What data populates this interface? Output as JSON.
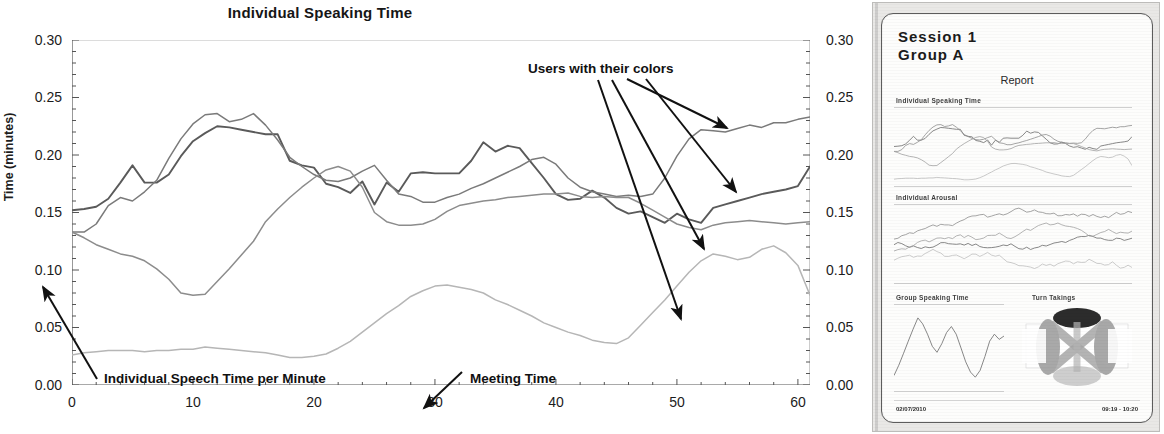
{
  "chart_data": {
    "type": "line",
    "title": "Individual Speaking Time",
    "xlabel": "Meeting Time",
    "ylabel": "Time (minutes)",
    "xlim": [
      0,
      61
    ],
    "ylim": [
      0.0,
      0.3
    ],
    "grid": false,
    "legend": "none",
    "x_ticks": [
      "0",
      "10",
      "20",
      "30",
      "40",
      "50",
      "60"
    ],
    "y_ticks": [
      "0.00",
      "0.05",
      "0.10",
      "0.15",
      "0.20",
      "0.25",
      "0.30"
    ],
    "y_ticks_right": [
      "0.00",
      "0.05",
      "0.10",
      "0.15",
      "0.20",
      "0.25",
      "0.30"
    ],
    "annotations": [
      {
        "text": "Users with their colors",
        "points_to": "four line series"
      },
      {
        "text": "Individual Speech Time per Minute",
        "points_to": "y axis"
      },
      {
        "text": "Meeting Time",
        "points_to": "x axis"
      }
    ],
    "x": [
      0,
      1,
      2,
      3,
      4,
      5,
      6,
      7,
      8,
      9,
      10,
      11,
      12,
      13,
      14,
      15,
      16,
      17,
      18,
      19,
      20,
      21,
      22,
      23,
      24,
      25,
      26,
      27,
      28,
      29,
      30,
      31,
      32,
      33,
      34,
      35,
      36,
      37,
      38,
      39,
      40,
      41,
      42,
      43,
      44,
      45,
      46,
      47,
      48,
      49,
      50,
      51,
      52,
      53,
      54,
      55,
      56,
      57,
      58,
      59,
      60,
      61
    ],
    "series": [
      {
        "name": "User 1",
        "color": "#5a5a5a",
        "values": [
          0.152,
          0.153,
          0.155,
          0.162,
          0.176,
          0.191,
          0.176,
          0.176,
          0.183,
          0.199,
          0.212,
          0.219,
          0.225,
          0.224,
          0.222,
          0.22,
          0.218,
          0.218,
          0.195,
          0.191,
          0.189,
          0.175,
          0.172,
          0.167,
          0.177,
          0.157,
          0.176,
          0.168,
          0.184,
          0.185,
          0.184,
          0.184,
          0.184,
          0.195,
          0.211,
          0.203,
          0.208,
          0.206,
          0.193,
          0.18,
          0.166,
          0.161,
          0.162,
          0.169,
          0.163,
          0.154,
          0.149,
          0.151,
          0.146,
          0.141,
          0.149,
          0.144,
          0.141,
          0.154,
          0.157,
          0.16,
          0.163,
          0.166,
          0.168,
          0.17,
          0.173,
          0.19
        ]
      },
      {
        "name": "User 2",
        "color": "#7a7a7a",
        "values": [
          0.133,
          0.133,
          0.14,
          0.156,
          0.163,
          0.16,
          0.168,
          0.178,
          0.197,
          0.214,
          0.227,
          0.235,
          0.236,
          0.229,
          0.231,
          0.236,
          0.226,
          0.213,
          0.198,
          0.19,
          0.183,
          0.178,
          0.177,
          0.18,
          0.186,
          0.191,
          0.178,
          0.166,
          0.164,
          0.159,
          0.159,
          0.163,
          0.166,
          0.171,
          0.175,
          0.18,
          0.185,
          0.19,
          0.196,
          0.198,
          0.192,
          0.18,
          0.172,
          0.168,
          0.166,
          0.164,
          0.165,
          0.164,
          0.166,
          0.18,
          0.199,
          0.214,
          0.222,
          0.221,
          0.22,
          0.223,
          0.226,
          0.224,
          0.228,
          0.228,
          0.231,
          0.233
        ]
      },
      {
        "name": "User 3",
        "color": "#8c8c8c",
        "values": [
          0.133,
          0.128,
          0.122,
          0.118,
          0.114,
          0.112,
          0.108,
          0.101,
          0.092,
          0.08,
          0.078,
          0.079,
          0.09,
          0.101,
          0.113,
          0.125,
          0.142,
          0.153,
          0.163,
          0.172,
          0.18,
          0.187,
          0.19,
          0.186,
          0.172,
          0.15,
          0.142,
          0.139,
          0.139,
          0.14,
          0.144,
          0.151,
          0.156,
          0.158,
          0.16,
          0.161,
          0.163,
          0.164,
          0.165,
          0.166,
          0.166,
          0.167,
          0.164,
          0.163,
          0.164,
          0.163,
          0.163,
          0.158,
          0.152,
          0.146,
          0.14,
          0.137,
          0.135,
          0.139,
          0.141,
          0.142,
          0.143,
          0.142,
          0.141,
          0.14,
          0.141,
          0.142
        ]
      },
      {
        "name": "User 4",
        "color": "#b6b6b6",
        "values": [
          0.026,
          0.028,
          0.029,
          0.03,
          0.03,
          0.03,
          0.029,
          0.03,
          0.03,
          0.031,
          0.031,
          0.033,
          0.032,
          0.031,
          0.03,
          0.029,
          0.028,
          0.026,
          0.024,
          0.024,
          0.025,
          0.027,
          0.032,
          0.038,
          0.046,
          0.054,
          0.062,
          0.069,
          0.077,
          0.082,
          0.086,
          0.087,
          0.085,
          0.083,
          0.08,
          0.074,
          0.07,
          0.065,
          0.06,
          0.054,
          0.05,
          0.046,
          0.043,
          0.039,
          0.037,
          0.036,
          0.041,
          0.052,
          0.063,
          0.074,
          0.086,
          0.098,
          0.108,
          0.114,
          0.112,
          0.109,
          0.111,
          0.118,
          0.121,
          0.115,
          0.104,
          0.078
        ]
      }
    ]
  },
  "report_panel": {
    "session_line1": "Session  1",
    "session_line2": "Group  A",
    "report_label": "Report",
    "section1_label": "Individual Speaking Time",
    "section2_label": "Individual Arousal",
    "section3_label": "Group Speaking Time",
    "section4_label": "Turn Takings",
    "footer_left": "02/07/2010",
    "footer_right": "09:19 - 10:20"
  },
  "colors": {
    "axis": "#3a3a3a",
    "text": "#1a1a1a",
    "annotation": "#111111",
    "panel_bg": "#e9e8e6",
    "card_bg": "#fdfdfc"
  }
}
